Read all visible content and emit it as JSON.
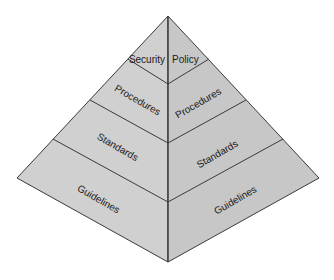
{
  "diagram": {
    "type": "pyramid",
    "colors": {
      "left_face": "#cfcfcf",
      "right_face": "#c6c6c6",
      "stroke": "#3a3a3a",
      "text": "#1a1a1a"
    },
    "levels": [
      {
        "left_label": "Security",
        "right_label": "Policy"
      },
      {
        "left_label": "Procedures",
        "right_label": "Procedures"
      },
      {
        "left_label": "Standards",
        "right_label": "Standards"
      },
      {
        "left_label": "Guidelines",
        "right_label": "Guidelines"
      }
    ]
  }
}
